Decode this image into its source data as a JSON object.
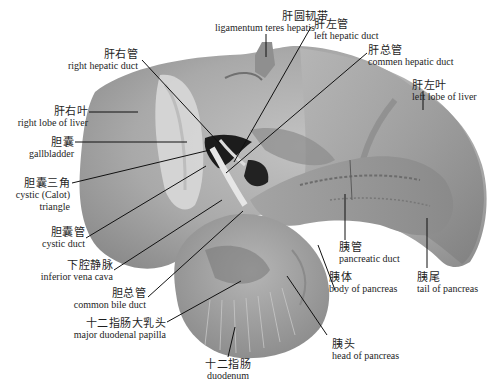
{
  "figure": {
    "colors": {
      "background": "#ffffff",
      "tissue_light": "#c9c9c9",
      "tissue_mid": "#a8a8a8",
      "tissue_dark": "#7a7a7a",
      "duct_dark": "#1a1a1a",
      "leader_line": "#111111",
      "text": "#1e1e1e"
    }
  },
  "labels": {
    "ligamentum_teres": {
      "zh": "肝圆韧带",
      "en": "ligamentum teres hepatis"
    },
    "left_hepatic_duct": {
      "zh": "肝左管",
      "en": "left hepatic duct"
    },
    "common_hepatic_duct": {
      "zh": "肝总管",
      "en": "commen hepatic duct"
    },
    "right_hepatic_duct": {
      "zh": "肝右管",
      "en": "right hepatic duct"
    },
    "left_lobe": {
      "zh": "肝左叶",
      "en": "left lobe of liver"
    },
    "right_lobe": {
      "zh": "肝右叶",
      "en": "right lobe of liver"
    },
    "gallbladder": {
      "zh": "胆囊",
      "en": "gallbladder"
    },
    "cystic_triangle": {
      "zh": "胆囊三角",
      "en1": "cystic (Calot)",
      "en2": "triangle"
    },
    "cystic_duct": {
      "zh": "胆囊管",
      "en": "cystic duct"
    },
    "ivc": {
      "zh": "下腔静脉",
      "en": "inferior vena cava"
    },
    "common_bile_duct": {
      "zh": "胆总管",
      "en": "common bile duct"
    },
    "papilla": {
      "zh": "十二指肠大乳头",
      "en": "major duodenal papilla"
    },
    "duodenum": {
      "zh": "十二指肠",
      "en": "duodenum"
    },
    "pancreatic_duct": {
      "zh": "胰管",
      "en": "pancreatic duct"
    },
    "body_pancreas": {
      "zh": "胰体",
      "en": "body of pancreas"
    },
    "tail_pancreas": {
      "zh": "胰尾",
      "en": "tail of pancreas"
    },
    "head_pancreas": {
      "zh": "胰头",
      "en": "head of pancreas"
    }
  }
}
